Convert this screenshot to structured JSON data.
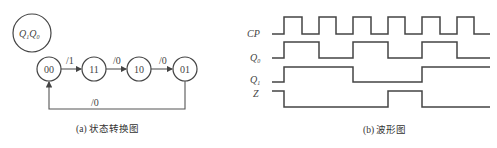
{
  "state_diagram": {
    "legend": {
      "q1": "Q",
      "q1_sub": "1",
      "q0": "Q",
      "q0_sub": "0"
    },
    "states": [
      "00",
      "11",
      "10",
      "01"
    ],
    "transitions": [
      {
        "from": "00",
        "to": "11",
        "label": "/1"
      },
      {
        "from": "11",
        "to": "10",
        "label": "/0"
      },
      {
        "from": "10",
        "to": "01",
        "label": "/0"
      },
      {
        "from": "01",
        "to": "00",
        "label": "/0"
      }
    ],
    "caption": "(a) 状态转换图"
  },
  "waveform": {
    "signals": [
      {
        "name": "CP",
        "sub": ""
      },
      {
        "name": "Q",
        "sub": "0"
      },
      {
        "name": "Q",
        "sub": "1"
      },
      {
        "name": "Z",
        "sub": ""
      }
    ],
    "caption": "(b) 波形图"
  }
}
